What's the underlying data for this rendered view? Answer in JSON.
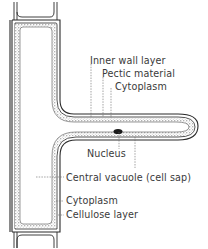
{
  "diagram": {
    "colors": {
      "wall_line": "#2a2a2a",
      "cytoplasm_stipple": "#5a5a5a",
      "nucleus": "#1a1a1a",
      "leader_line": "#666666",
      "label_text": "#3a3a3a",
      "background": "#ffffff"
    },
    "labels": [
      {
        "id": "inner-wall-layer",
        "text": "Inner wall layer"
      },
      {
        "id": "pectic-material",
        "text": "Pectic material"
      },
      {
        "id": "cytoplasm-upper",
        "text": "Cytoplasm"
      },
      {
        "id": "nucleus",
        "text": "Nucleus"
      },
      {
        "id": "central-vacuole",
        "text": "Central vacuole (cell sap)"
      },
      {
        "id": "cytoplasm-lower",
        "text": "Cytoplasm"
      },
      {
        "id": "cellulose-layer",
        "text": "Cellulose layer"
      }
    ]
  }
}
